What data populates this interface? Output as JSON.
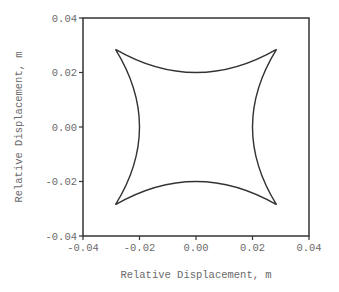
{
  "chart_data": {
    "type": "line",
    "title": "",
    "xlabel": "Relative Displacement, m",
    "ylabel": "Relative Displacement, m",
    "xlim": [
      -0.04,
      0.04
    ],
    "ylim": [
      -0.04,
      0.04
    ],
    "xticks": [
      -0.04,
      -0.02,
      0.0,
      0.02,
      0.04
    ],
    "yticks": [
      -0.04,
      -0.02,
      0.0,
      0.02,
      0.04
    ],
    "xtick_labels": [
      "-0.04",
      "-0.02",
      "0.00",
      "0.02",
      "0.04"
    ],
    "ytick_labels": [
      "-0.04",
      "-0.02",
      "0.00",
      "0.02",
      "0.04"
    ],
    "grid": false,
    "legend": null,
    "series": [
      {
        "name": "relative displacement orbit",
        "description": "closed concave-square (astroid-like) curve with four cusps",
        "cusps": [
          [
            -0.0285,
            0.0285
          ],
          [
            0.0285,
            0.0285
          ],
          [
            0.0285,
            -0.0285
          ],
          [
            -0.0285,
            -0.0285
          ]
        ],
        "side_midpoints": [
          [
            0.0,
            0.02
          ],
          [
            0.02,
            0.0
          ],
          [
            0.0,
            -0.02
          ],
          [
            -0.02,
            0.0
          ]
        ],
        "x": [
          -0.0285,
          -0.02,
          -0.01,
          0.0,
          0.01,
          0.02,
          0.0285,
          0.02,
          0.0,
          -0.02,
          -0.0285
        ],
        "y": [
          0.0285,
          0.0236,
          0.0209,
          0.02,
          0.0209,
          0.0236,
          0.0285,
          0.0236,
          0.02,
          0.0236,
          0.0285
        ],
        "color": "#333333"
      }
    ]
  }
}
